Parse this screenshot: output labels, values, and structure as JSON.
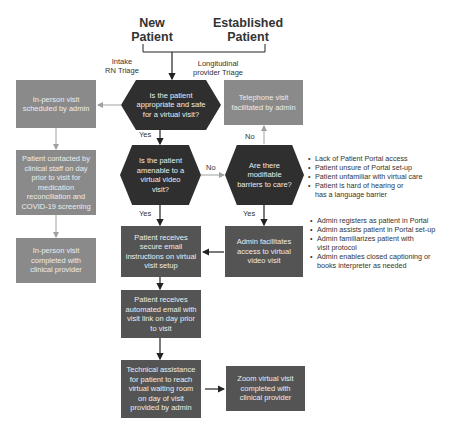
{
  "headers": {
    "new_patient": "New\nPatient",
    "established_patient": "Established\nPatient"
  },
  "triage": {
    "intake": "Intake\nRN Triage",
    "longitudinal": "Longitudinal\nprovider Triage"
  },
  "decisions": {
    "appropriate": "Is the patient appropriate and safe for a virtual visit?",
    "amenable": "Is the patient amenable to a virtual video visit?",
    "barriers": "Are there modifiable barriers to care?"
  },
  "boxes": {
    "inperson_scheduled": "In-person visit scheduled by admin",
    "patient_contacted": "Patient contacted by clinical staff on day prior to visit for medication reconciliation and COVID-19 screening",
    "inperson_completed": "In-person visit completed with clinical provider",
    "telephone": "Telephone visit facilitated by admin",
    "secure_email": "Patient receives secure email instructions on virtual visit setup",
    "admin_facilitates": "Admin facilitates access to virtual video visit",
    "automated_email": "Patient receives automated email with visit link on day prior to visit",
    "technical_assistance": "Technical assistance for patient to reach virtual waiting room on day of visit provided by admin",
    "zoom_completed": "Zoom virtual visit completed with clinical provider"
  },
  "edge_labels": {
    "yes1": "Yes",
    "yes2": "Yes",
    "yes3": "Yes",
    "no1": "No",
    "no2": "No"
  },
  "barrier_list": [
    "Lack of Patient Portal access",
    "Patient unsure of Portal set-up",
    "Patient unfamiliar with virtual care",
    "Patient is hard of hearing or has a language barrier"
  ],
  "admin_list": [
    "Admin registers as patient in Portal",
    "Admin assists patient in Portal set-up",
    "Admin familiarizes patient with visit protocol",
    "Admin enables closed captioning or books interpreter as needed"
  ],
  "colors": {
    "decision": "#2f2f2f",
    "process_dark": "#545454",
    "process_light": "#8a8a8a",
    "connector_dark": "#222222",
    "connector_light": "#a0a0a0"
  }
}
